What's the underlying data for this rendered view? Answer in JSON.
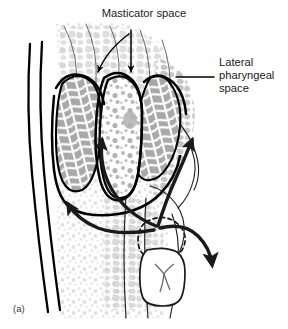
{
  "figure": {
    "panel_label": "(a)",
    "caption_labels": {
      "masticator": "Masticator space",
      "lateral_line1": "Lateral",
      "lateral_line2": "pharyngeal",
      "lateral_line3": "space"
    }
  },
  "labels": [
    {
      "id": "masticator-space-label",
      "text": "Masticator space",
      "position": "top-center",
      "leader": "forked-double-arrow-down"
    },
    {
      "id": "lateral-pharyngeal-space-label",
      "text": "Lateral pharyngeal space",
      "lines": [
        "Lateral",
        "pharyngeal",
        "space"
      ],
      "position": "right",
      "leader": "horizontal-line"
    }
  ],
  "anatomy": {
    "regions": [
      {
        "name": "skin-fascia-layers",
        "description": "two thick black parallel lines at left margin"
      },
      {
        "name": "subcutaneous-tissue",
        "description": "light gray stippled areolar tissue"
      },
      {
        "name": "masseter-muscle",
        "description": "gray striated muscle belly, left of center"
      },
      {
        "name": "medial-pterygoid-muscle",
        "description": "gray striated muscle belly, right of center"
      },
      {
        "name": "masticator-fat-space",
        "description": "white stippled space between muscle bellies"
      },
      {
        "name": "lateral-pharyngeal-space",
        "description": "gray tissue right of the pterygoid"
      },
      {
        "name": "periapical-abscess",
        "description": "dashed circular outline at tooth apex"
      },
      {
        "name": "mandibular-molar",
        "description": "tooth with cruciate occlusal fissure pattern"
      },
      {
        "name": "mandible-cortex",
        "description": "thin outline of mandibular bone"
      }
    ],
    "spread_arrows": [
      {
        "id": "arrow-to-masseter",
        "direction": "up",
        "target": "masseter-muscle"
      },
      {
        "id": "arrow-to-pterygoid",
        "direction": "up-right",
        "target": "medial-pterygoid-muscle"
      },
      {
        "id": "arrow-to-buccal",
        "direction": "up-left",
        "target": "subcutaneous-tissue"
      },
      {
        "id": "arrow-to-lateral",
        "direction": "right-down",
        "target": "lateral-pharyngeal-space"
      }
    ]
  },
  "colors": {
    "outline": "#000000",
    "muscle_fill": "#a8a8a8",
    "muscle_fiber": "#ffffff",
    "tissue_light": "#e2e2e2",
    "tissue_mid": "#c9c9c9",
    "stipple": "#b4b4b4",
    "background": "#ffffff",
    "label_text": "#1a1a1a",
    "arrow": "#1a1a1a"
  }
}
